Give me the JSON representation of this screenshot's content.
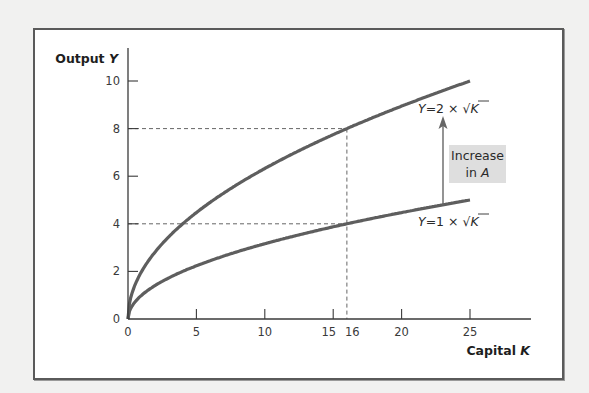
{
  "chart_data": {
    "type": "line",
    "title": "",
    "xlabel": "Capital K",
    "ylabel": "Output Y",
    "xlim": [
      0,
      29
    ],
    "ylim": [
      0,
      11
    ],
    "x_ticks": [
      0,
      5,
      10,
      15,
      16,
      20,
      25
    ],
    "x_tick_labels": [
      "0",
      "5",
      "10",
      "15",
      "16",
      "20",
      "25"
    ],
    "y_ticks": [
      0,
      2,
      4,
      6,
      8,
      10
    ],
    "y_tick_labels": [
      "0",
      "2",
      "4",
      "6",
      "8",
      "10"
    ],
    "grid": false,
    "series": [
      {
        "name": "Y=2 × √K",
        "formula": "Y = 2 * sqrt(K)",
        "A": 2,
        "x": [
          0,
          1,
          4,
          9,
          16,
          25
        ],
        "values": [
          0,
          2,
          4,
          6,
          8,
          10
        ]
      },
      {
        "name": "Y=1 × √K",
        "formula": "Y = 1 * sqrt(K)",
        "A": 1,
        "x": [
          0,
          1,
          4,
          9,
          16,
          25
        ],
        "values": [
          0,
          1,
          2,
          3,
          4,
          5
        ]
      }
    ],
    "reference_lines": [
      {
        "type": "horizontal",
        "y": 8,
        "x_to": 16,
        "style": "dashed"
      },
      {
        "type": "horizontal",
        "y": 4,
        "x_to": 16,
        "style": "dashed"
      },
      {
        "type": "vertical",
        "x": 16,
        "y_to": 8,
        "style": "dashed"
      }
    ],
    "annotations": [
      {
        "text": "Increase in A",
        "line1": "Increase",
        "line2": "in ",
        "italic": "A",
        "arrow_from": [
          23,
          4.6
        ],
        "arrow_to": [
          23,
          8.5
        ]
      }
    ],
    "labels": {
      "y_axis": {
        "prefix": "Output ",
        "var": "Y"
      },
      "x_axis": {
        "prefix": "Capital ",
        "var": "K"
      },
      "upper_curve": {
        "var": "Y",
        "eq": "=2 × √",
        "k": "K"
      },
      "lower_curve": {
        "var": "Y",
        "eq": "=1 × √",
        "k": "K"
      }
    }
  },
  "colors": {
    "background": "#f1f1f0",
    "frame": "#5a5a5a",
    "curve": "#5e5e5e",
    "axis": "#3a3a3a",
    "dashed": "#555555",
    "annotation_box": "#dedede",
    "arrow": "#666666"
  }
}
